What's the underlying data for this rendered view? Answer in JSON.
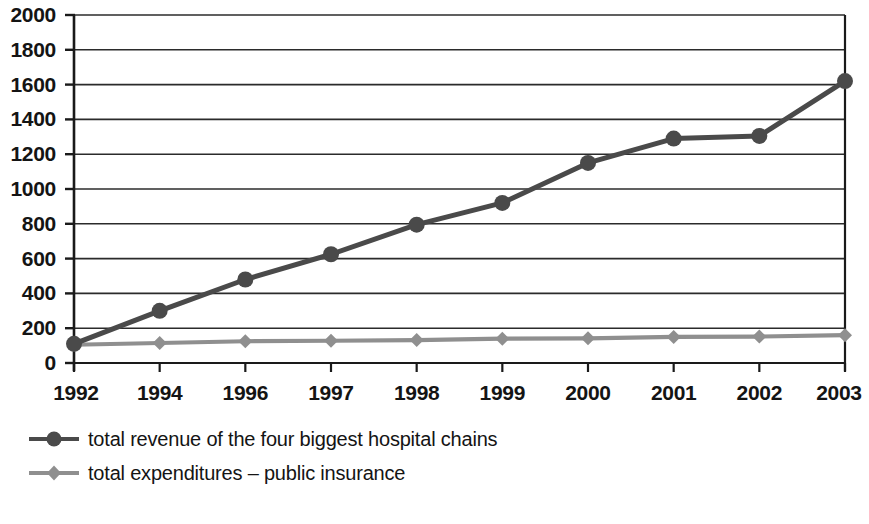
{
  "chart_data": {
    "type": "line",
    "title": "",
    "xlabel": "",
    "ylabel": "",
    "categories": [
      "1992",
      "1994",
      "1996",
      "1997",
      "1998",
      "1999",
      "2000",
      "2001",
      "2002",
      "2003"
    ],
    "series": [
      {
        "name": "total revenue of the four biggest hospital chains",
        "color": "#4a4a4a",
        "marker": "circle",
        "values": [
          110,
          300,
          480,
          625,
          795,
          920,
          1150,
          1290,
          1305,
          1620
        ]
      },
      {
        "name": "total expenditures – public insurance",
        "color": "#8f8f8f",
        "marker": "diamond",
        "values": [
          105,
          115,
          125,
          128,
          132,
          140,
          142,
          150,
          152,
          160
        ]
      }
    ],
    "ylim": [
      0,
      2000
    ],
    "yticks": [
      0,
      200,
      400,
      600,
      800,
      1000,
      1200,
      1400,
      1600,
      1800,
      2000
    ],
    "ytick_labels": [
      "0",
      "200",
      "400",
      "600",
      "800",
      "1000",
      "1200",
      "1400",
      "1600",
      "1800",
      "2000"
    ],
    "xtick_labels": [
      "1992",
      "1994",
      "1996",
      "1997",
      "1998",
      "1999",
      "2000",
      "2001",
      "2002",
      "2003"
    ],
    "grid": "horizontal",
    "legend_position": "bottom-left"
  },
  "legend": {
    "items": [
      {
        "label": "total revenue of the four biggest hospital chains",
        "color": "#4a4a4a",
        "marker": "circle"
      },
      {
        "label": "total expenditures – public insurance",
        "color": "#8f8f8f",
        "marker": "diamond"
      }
    ]
  },
  "colors": {
    "series_dark": "#4a4a4a",
    "series_light": "#8f8f8f",
    "axis": "#1a1a1a",
    "grid": "#2b2b2b",
    "background": "#ffffff"
  }
}
